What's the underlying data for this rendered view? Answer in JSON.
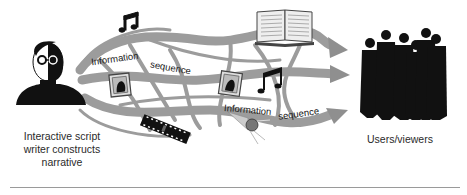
{
  "diagram": {
    "left_caption_lines": [
      "Interactive script",
      "writer constructs",
      "narrative"
    ],
    "right_caption": "Users/viewers",
    "flow_labels": [
      {
        "text": "Information"
      },
      {
        "text": "sequence"
      },
      {
        "text": "Information"
      },
      {
        "text": "sequence"
      }
    ],
    "icons": [
      "writer-portrait",
      "music-note",
      "framed-picture",
      "film-strip",
      "open-book",
      "music-note",
      "framed-picture",
      "microphone",
      "people-group"
    ],
    "colors": {
      "stream": "#9c9c9c",
      "stream_dark": "#8a8a8a",
      "silhouette": "#111111",
      "divider": "#9a9a9a"
    }
  }
}
